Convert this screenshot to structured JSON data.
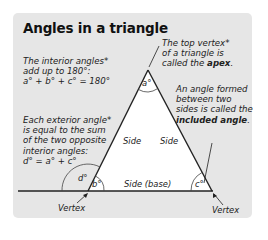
{
  "title": "Angles in a triangle",
  "notes": {
    "interior_sum": {
      "lines": [
        "The interior angles*",
        "add up to 180°:",
        "a° + b° + c° = 180°"
      ]
    },
    "apex": {
      "lines": [
        "The top vertex*",
        "of a triangle is"
      ],
      "line3_prefix": "called the ",
      "line3_bold": "apex",
      "line3_suffix": "."
    },
    "included_angle": {
      "lines": [
        "An angle formed",
        "between two",
        "sides is called the"
      ],
      "line4_bold": "included angle",
      "line4_suffix": "."
    },
    "exterior_angle": {
      "lines": [
        "Each exterior angle*",
        "is equal to the sum",
        "of the two opposite",
        "interior angles:",
        "d° = a° + c°"
      ]
    }
  },
  "labels": {
    "angle_a": "a°",
    "angle_b": "b°",
    "angle_c": "c°",
    "angle_d": "d°",
    "side_left": "Side",
    "side_right": "Side",
    "side_base": "Side (base)",
    "vertex_left": "Vertex",
    "vertex_right": "Vertex"
  },
  "colors": {
    "panel": "#e6e6e6",
    "triangle_fill": "#ffffff",
    "stroke": "#222222"
  }
}
